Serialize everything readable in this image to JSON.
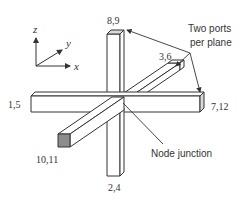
{
  "diagram": {
    "type": "3d-node-junction",
    "axes": {
      "z_label": "z",
      "y_label": "y",
      "x_label": "x"
    },
    "ports": {
      "top": "8,9",
      "back": "3,6",
      "left": "1,5",
      "right": "7,12",
      "front": "10,11",
      "bottom": "2,4"
    },
    "annotations": {
      "two_ports_line1": "Two ports",
      "two_ports_line2": "per plane",
      "node_junction": "Node junction"
    },
    "colors": {
      "stroke": "#333333",
      "fill": "#ffffff",
      "cap_shade": "#d9d9d9",
      "front_face": "#8c8c8c"
    }
  }
}
